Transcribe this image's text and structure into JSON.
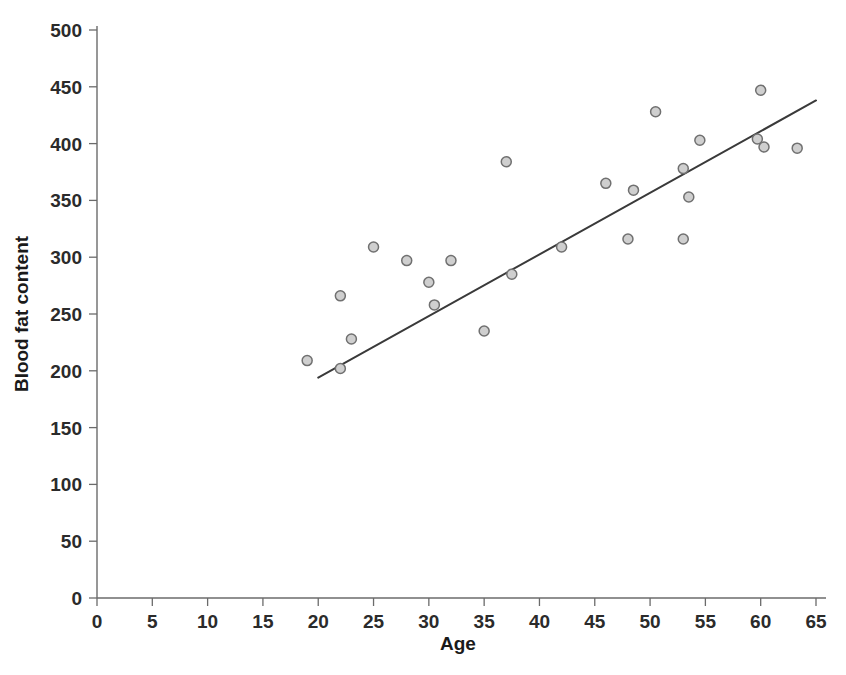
{
  "chart_data": {
    "type": "scatter",
    "title": "",
    "xlabel": "Age",
    "ylabel": "Blood fat content",
    "xlim": [
      0,
      65
    ],
    "ylim": [
      0,
      500
    ],
    "xticks": [
      0,
      5,
      10,
      15,
      20,
      25,
      30,
      35,
      40,
      45,
      50,
      55,
      60,
      65
    ],
    "yticks": [
      0,
      50,
      100,
      150,
      200,
      250,
      300,
      350,
      400,
      450,
      500
    ],
    "grid": false,
    "legend": null,
    "marker": {
      "shape": "circle",
      "fill_color": "#cfcfcf",
      "edge_color": "#707070",
      "radius_px": 5
    },
    "points": [
      {
        "x": 19,
        "y": 209
      },
      {
        "x": 22,
        "y": 266
      },
      {
        "x": 22,
        "y": 202
      },
      {
        "x": 23,
        "y": 228
      },
      {
        "x": 25,
        "y": 309
      },
      {
        "x": 28,
        "y": 297
      },
      {
        "x": 30,
        "y": 278
      },
      {
        "x": 30.5,
        "y": 258
      },
      {
        "x": 32,
        "y": 297
      },
      {
        "x": 35,
        "y": 235
      },
      {
        "x": 37,
        "y": 384
      },
      {
        "x": 37.5,
        "y": 285
      },
      {
        "x": 42,
        "y": 309
      },
      {
        "x": 46,
        "y": 365
      },
      {
        "x": 48,
        "y": 316
      },
      {
        "x": 48.5,
        "y": 359
      },
      {
        "x": 50.5,
        "y": 428
      },
      {
        "x": 53,
        "y": 316
      },
      {
        "x": 53,
        "y": 378
      },
      {
        "x": 53.5,
        "y": 353
      },
      {
        "x": 54.5,
        "y": 403
      },
      {
        "x": 59.7,
        "y": 404
      },
      {
        "x": 60,
        "y": 447
      },
      {
        "x": 60.3,
        "y": 397
      },
      {
        "x": 63.3,
        "y": 396
      }
    ],
    "trend_line": {
      "type": "linear-fit",
      "x_start": 20,
      "y_start": 194,
      "x_end": 65,
      "y_end": 438,
      "color": "#3a3a3a"
    }
  }
}
